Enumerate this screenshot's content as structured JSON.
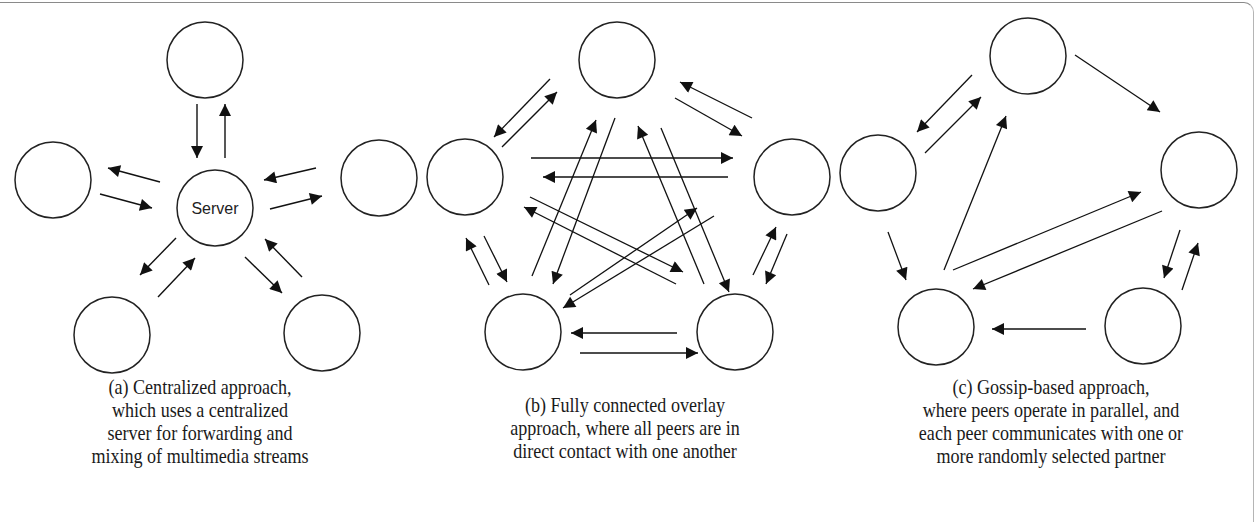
{
  "figure": {
    "panels": [
      {
        "id": "a",
        "server_label": "Server",
        "caption": [
          "(a) Centralized approach,",
          "which uses a centralized",
          "server for forwarding and",
          "mixing of multimedia streams"
        ],
        "nodes": [
          {
            "name": "peer-top",
            "cx": 205,
            "cy": 60
          },
          {
            "name": "peer-left",
            "cx": 53,
            "cy": 180
          },
          {
            "name": "server",
            "cx": 215,
            "cy": 208,
            "label": "Server"
          },
          {
            "name": "peer-right",
            "cx": 379,
            "cy": 178
          },
          {
            "name": "peer-bottom-left",
            "cx": 112,
            "cy": 335
          },
          {
            "name": "peer-bottom-right",
            "cx": 322,
            "cy": 333
          }
        ]
      },
      {
        "id": "b",
        "caption": [
          "(b) Fully connected overlay",
          "approach, where all peers are in",
          "direct contact with one another"
        ],
        "nodes": [
          {
            "name": "peer-top",
            "cx": 617,
            "cy": 60
          },
          {
            "name": "peer-left",
            "cx": 465,
            "cy": 177
          },
          {
            "name": "peer-right",
            "cx": 792,
            "cy": 177
          },
          {
            "name": "peer-bottom-left",
            "cx": 523,
            "cy": 332
          },
          {
            "name": "peer-bottom-right",
            "cx": 735,
            "cy": 332
          }
        ]
      },
      {
        "id": "c",
        "caption": [
          "(c) Gossip-based approach,",
          "where peers operate in parallel, and",
          "each peer communicates with one or",
          "more randomly selected partner"
        ],
        "nodes": [
          {
            "name": "peer-top",
            "cx": 1028,
            "cy": 56
          },
          {
            "name": "peer-left",
            "cx": 878,
            "cy": 173
          },
          {
            "name": "peer-right",
            "cx": 1199,
            "cy": 170
          },
          {
            "name": "peer-bottom-left",
            "cx": 936,
            "cy": 327
          },
          {
            "name": "peer-bottom-right",
            "cx": 1143,
            "cy": 326
          }
        ]
      }
    ]
  }
}
